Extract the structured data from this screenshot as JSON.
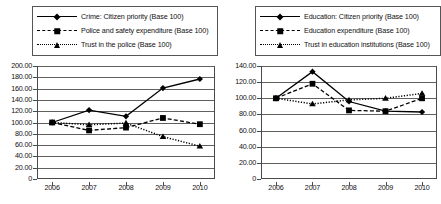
{
  "chart_data": [
    {
      "type": "line",
      "title": "",
      "xlabel": "",
      "ylabel": "",
      "categories": [
        "2006",
        "2007",
        "2008",
        "2009",
        "2010"
      ],
      "x": [
        2006,
        2007,
        2008,
        2009,
        2010
      ],
      "ylim": [
        0,
        200
      ],
      "ytick_step": 20,
      "ytick_labels": [
        "0",
        "20.00",
        "40.00",
        "60.00",
        "80.00",
        "100.00",
        "120.00",
        "140.00",
        "160.00",
        "180.00",
        "200.00"
      ],
      "grid": true,
      "legend_position": "above-plot",
      "series": [
        {
          "name": "Crime: Citizen priority (Base 100)",
          "marker": "diamond",
          "line_style": "solid",
          "color": "#000000",
          "values": [
            100,
            122,
            111,
            161,
            177
          ]
        },
        {
          "name": "Police and safety expenditure (Base 100)",
          "marker": "square",
          "line_style": "dashed",
          "color": "#000000",
          "values": [
            100,
            86,
            91,
            108,
            97
          ]
        },
        {
          "name": "Trust in the police (Base 100)",
          "marker": "triangle",
          "line_style": "dotted",
          "color": "#000000",
          "values": [
            100,
            96,
            99,
            75,
            58
          ]
        }
      ]
    },
    {
      "type": "line",
      "title": "",
      "xlabel": "",
      "ylabel": "",
      "categories": [
        "2006",
        "2007",
        "2008",
        "2009",
        "2010"
      ],
      "x": [
        2006,
        2007,
        2008,
        2009,
        2010
      ],
      "ylim": [
        0,
        140
      ],
      "ytick_step": 20,
      "ytick_labels": [
        "0",
        "20.00",
        "40.00",
        "60.00",
        "80.00",
        "100.00",
        "120.00",
        "140.00"
      ],
      "grid": true,
      "legend_position": "above-plot",
      "series": [
        {
          "name": "Education: Citizen priority (Base 100)",
          "marker": "diamond",
          "line_style": "solid",
          "color": "#000000",
          "values": [
            100,
            133,
            96,
            84,
            83
          ]
        },
        {
          "name": "Education expenditure (Base 100)",
          "marker": "square",
          "line_style": "dashed",
          "color": "#000000",
          "values": [
            100,
            118,
            85,
            84,
            100
          ]
        },
        {
          "name": "Trust in education institutions (Base 100)",
          "marker": "triangle",
          "line_style": "dotted",
          "color": "#000000",
          "values": [
            100,
            93,
            98,
            100,
            106
          ]
        }
      ]
    }
  ]
}
